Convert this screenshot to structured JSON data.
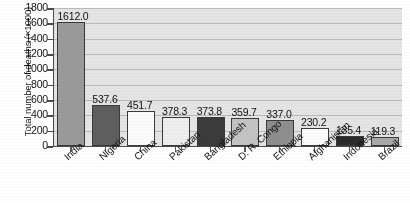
{
  "chart_data": {
    "type": "bar",
    "title": "",
    "xlabel": "",
    "ylabel": "Total number of deaths (×1000)",
    "ylim": [
      0,
      1800
    ],
    "ytick_step": 200,
    "grid": "horizontal",
    "legend": "none",
    "categories": [
      "India",
      "Nigeria",
      "China",
      "Pakistan",
      "Bangladesh",
      "D. R. Congo",
      "Ethiopia",
      "Afghanistan",
      "Indonesia",
      "Brazil"
    ],
    "values": [
      1612.0,
      537.6,
      451.7,
      378.3,
      373.8,
      359.7,
      337.0,
      230.2,
      135.4,
      119.3
    ],
    "value_labels": [
      "1612.0",
      "537.6",
      "451.7",
      "378.3",
      "373.8",
      "359.7",
      "337.0",
      "230.2",
      "135.4",
      "119.3"
    ],
    "ytick_labels": [
      "1800",
      "1600",
      "1400",
      "1200",
      "1000",
      "800",
      "600",
      "400",
      "200",
      "0"
    ],
    "ytick_values": [
      1800,
      1600,
      1400,
      1200,
      1000,
      800,
      600,
      400,
      200,
      0
    ],
    "bar_colors": [
      "#9a9a9a",
      "#5e5e5e",
      "#fbfbfb",
      "#ededed",
      "#3b3b3b",
      "#c3c3c3",
      "#8e8e8e",
      "#fcfcfc",
      "#2b2b2b",
      "#a9a9a9"
    ],
    "bar_edge_color": "#3a3a3a",
    "plot_background": "#e4e4e4",
    "gridline_color": "#b9b9b9",
    "axis_color": "#4a4a4a",
    "figure_background": "#ffffff"
  }
}
